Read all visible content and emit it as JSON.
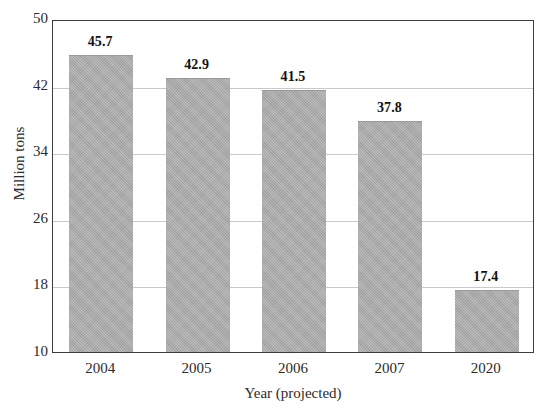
{
  "chart_data": {
    "type": "bar",
    "title": "",
    "title_note": "cropped off at top edge of image",
    "categories": [
      "2004",
      "2005",
      "2006",
      "2007",
      "2020"
    ],
    "values": [
      45.7,
      42.9,
      41.5,
      37.8,
      17.4
    ],
    "value_labels": [
      "45.7",
      "42.9",
      "41.5",
      "37.8",
      "17.4"
    ],
    "xlabel": "Year (projected)",
    "ylabel": "Million tons",
    "ylim": [
      10,
      50
    ],
    "ytick_labels": [
      "10",
      "18",
      "26",
      "34",
      "42",
      "50"
    ],
    "ytick_values": [
      10,
      18,
      26,
      34,
      42,
      50
    ],
    "ystep": 8,
    "grid": true,
    "grid_axis": "y",
    "legend": false,
    "legend_position": "none",
    "bar_color": "#a9a9a9",
    "grid_color": "#c9c9c9",
    "frame_color": "#3d3d3d",
    "background_color": "#ffffff"
  }
}
